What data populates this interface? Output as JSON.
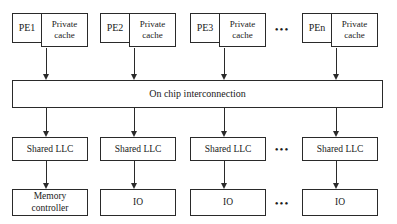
{
  "diagram": {
    "interconnect": {
      "label": "On chip interconnection"
    },
    "pe_nodes": [
      {
        "pe_label": "PE1",
        "cache_label": "Private\ncache"
      },
      {
        "pe_label": "PE2",
        "cache_label": "Private\ncache"
      },
      {
        "pe_label": "PE3",
        "cache_label": "Private\ncache"
      },
      {
        "pe_label": "PEn",
        "cache_label": "Private\ncache"
      }
    ],
    "llc_nodes": [
      {
        "label": "Shared LLC"
      },
      {
        "label": "Shared LLC"
      },
      {
        "label": "Shared LLC"
      },
      {
        "label": "Shared LLC"
      }
    ],
    "device_nodes": [
      {
        "label": "Memory\ncontroller"
      },
      {
        "label": "IO"
      },
      {
        "label": "IO"
      },
      {
        "label": "IO"
      }
    ],
    "ellipses": {
      "pe_row": "•••",
      "llc_row": "•••",
      "device_row": "•••"
    },
    "colors": {
      "stroke": "#2a2a2a",
      "text": "#1a1a1a",
      "background": "#ffffff"
    }
  }
}
